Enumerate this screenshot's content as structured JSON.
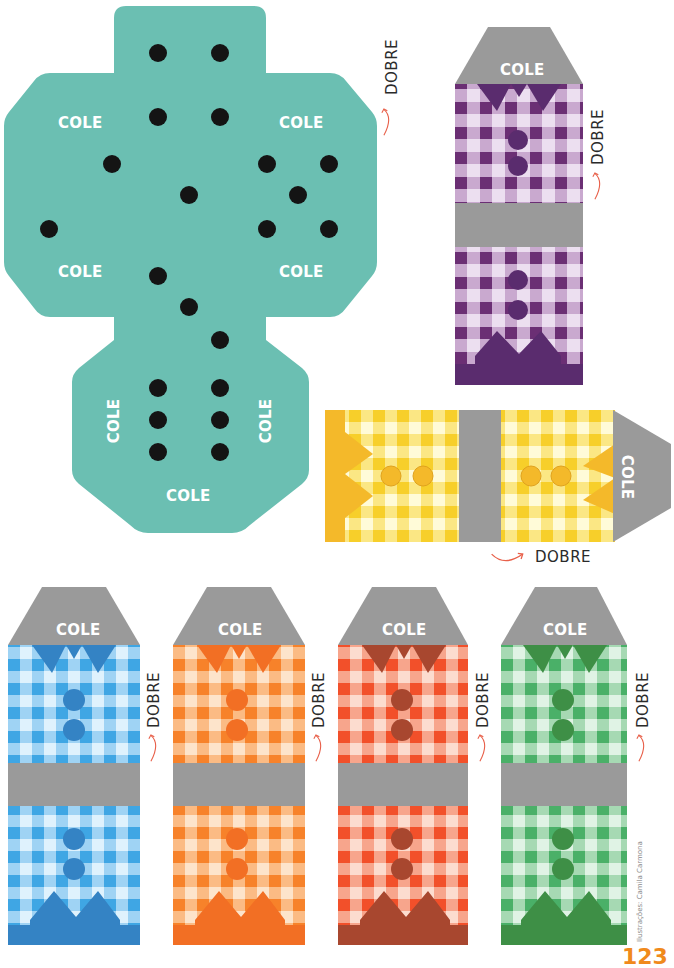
{
  "labels": {
    "glue": "COLE",
    "fold": "DOBRE"
  },
  "credit": "Ilustrações: Camila Carmona",
  "page_number": "123",
  "colors": {
    "teal": "#6bbfb2",
    "gray": "#9a9a9a",
    "dot": "#141414",
    "arrow": "#e8604a"
  },
  "die_net": {
    "glue_labels": [
      "COLE",
      "COLE",
      "COLE",
      "COLE",
      "COLE",
      "COLE",
      "COLE"
    ],
    "faces": [
      {
        "face": "top",
        "pips": 2
      },
      {
        "face": "upper-middle",
        "pips": 2
      },
      {
        "face": "left",
        "pips": 2
      },
      {
        "face": "center",
        "pips": 3
      },
      {
        "face": "right",
        "pips": 5
      },
      {
        "face": "bottom",
        "pips": 6
      }
    ]
  },
  "shirts": [
    {
      "id": "purple",
      "main": "#6b2f74",
      "light": "#c9a9cf",
      "pale": "#ecdff0",
      "dark": "#5a2c6e",
      "orientation": "vertical"
    },
    {
      "id": "yellow",
      "main": "#f7cf2a",
      "light": "#fbe784",
      "pale": "#fffbd8",
      "dark": "#f4b92a",
      "orientation": "horizontal"
    },
    {
      "id": "blue",
      "main": "#3fa6e4",
      "light": "#9fd3f4",
      "pale": "#dff2fd",
      "dark": "#3483c4",
      "orientation": "vertical"
    },
    {
      "id": "orange",
      "main": "#f7822a",
      "light": "#fbbb84",
      "pale": "#fde4cb",
      "dark": "#f26f24",
      "orientation": "vertical"
    },
    {
      "id": "red",
      "main": "#f2502a",
      "light": "#f7a58c",
      "pale": "#fcdccf",
      "dark": "#a8472f",
      "orientation": "vertical"
    },
    {
      "id": "green",
      "main": "#4ab068",
      "light": "#a6d9b3",
      "pale": "#e0f3e5",
      "dark": "#3e8f46",
      "orientation": "vertical"
    }
  ]
}
